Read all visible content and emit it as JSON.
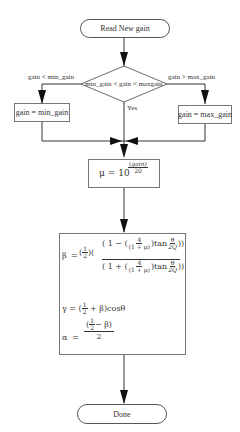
{
  "diagram": {
    "nodes": {
      "start": {
        "label": "Read New gain"
      },
      "decision": {
        "label": "min_gain < gain < maxgain"
      },
      "clamp_min": {
        "label": "gain = min_gain"
      },
      "clamp_max": {
        "label": "gain = max_gain"
      },
      "mu_calc": {
        "lhs": "μ",
        "eq": "=",
        "base": "10",
        "exp_num": "(gain)",
        "exp_den": "20"
      },
      "coeff_calc": {
        "beta": {
          "lhs": "β",
          "eq": "=",
          "half_num": "1",
          "half_den": "2",
          "num_term": "1 −",
          "den_term": "1 +",
          "frac_num": "4",
          "frac_den": "(1 + μ)",
          "tan": "tan",
          "theta": "θ",
          "twoQ": "2Q"
        },
        "gamma": {
          "lhs": "γ",
          "eq": "=",
          "half_num": "1",
          "half_den": "2",
          "plus_beta": "+ β",
          "cos": "cosθ"
        },
        "alpha": {
          "lhs": "α",
          "eq": "=",
          "half_num": "1",
          "half_den": "2",
          "minus_beta": "− β",
          "den": "2"
        }
      },
      "end": {
        "label": "Done"
      }
    },
    "edges": {
      "left_branch": {
        "label": "gain < min_gain"
      },
      "right_branch": {
        "label": "gain > max_gain"
      },
      "down_branch": {
        "label": "Yes"
      }
    }
  }
}
